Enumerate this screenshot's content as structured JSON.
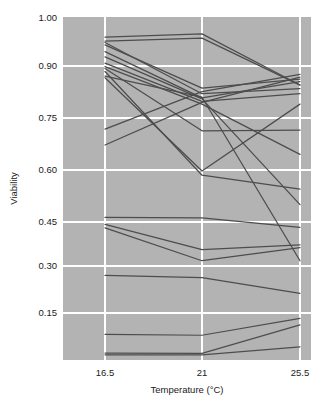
{
  "chart_data": {
    "type": "line",
    "title": "",
    "subtitle": "",
    "xlabel": "Temperature (°C)",
    "ylabel": "Viability",
    "x": [
      16.5,
      21,
      25.5
    ],
    "xtick_labels": [
      "16.5",
      "21",
      "25.5"
    ],
    "ytick_labels": [
      "1.00",
      "0.90",
      "0.75",
      "0.60",
      "0.45",
      "0.30",
      "0.15"
    ],
    "ytick_values": [
      1.0,
      0.9,
      0.75,
      0.6,
      0.45,
      0.3,
      0.15
    ],
    "ylim": [
      0.01,
      1.0
    ],
    "xlim": [
      14.8,
      27.2
    ],
    "grid": true,
    "grid_color": "#ffffff",
    "panel_background": "#b3b3b3",
    "line_color": "#4d4d4d",
    "legend": "none",
    "series": [
      {
        "name": "s01",
        "values": [
          0.96,
          0.967,
          0.845
        ]
      },
      {
        "name": "s02",
        "values": [
          0.952,
          0.958,
          0.845
        ]
      },
      {
        "name": "s03",
        "values": [
          0.949,
          0.82,
          0.835
        ]
      },
      {
        "name": "s04",
        "values": [
          0.944,
          0.836,
          0.862
        ]
      },
      {
        "name": "s05",
        "values": [
          0.93,
          0.808,
          0.855
        ]
      },
      {
        "name": "s06",
        "values": [
          0.919,
          0.805,
          0.5
        ]
      },
      {
        "name": "s07",
        "values": [
          0.906,
          0.798,
          0.82
        ]
      },
      {
        "name": "s08",
        "values": [
          0.898,
          0.79,
          0.645
        ]
      },
      {
        "name": "s09",
        "values": [
          0.893,
          0.713,
          0.715
        ]
      },
      {
        "name": "s10",
        "values": [
          0.884,
          0.585,
          0.545
        ]
      },
      {
        "name": "s11",
        "values": [
          0.871,
          0.81,
          0.318
        ]
      },
      {
        "name": "s12",
        "values": [
          0.866,
          0.597,
          0.79
        ]
      },
      {
        "name": "s13",
        "values": [
          0.718,
          0.826,
          0.876
        ]
      },
      {
        "name": "s14",
        "values": [
          0.672,
          0.795,
          0.868
        ]
      },
      {
        "name": "s15",
        "values": [
          0.463,
          0.462,
          0.432
        ]
      },
      {
        "name": "s16",
        "values": [
          0.442,
          0.356,
          0.372
        ]
      },
      {
        "name": "s17",
        "values": [
          0.43,
          0.318,
          0.363
        ]
      },
      {
        "name": "s18",
        "values": [
          0.27,
          0.263,
          0.213
        ]
      },
      {
        "name": "s19",
        "values": [
          0.082,
          0.079,
          0.133
        ]
      },
      {
        "name": "s20",
        "values": [
          0.022,
          0.021,
          0.112
        ]
      },
      {
        "name": "s21",
        "values": [
          0.016,
          0.016,
          0.042
        ]
      }
    ]
  }
}
